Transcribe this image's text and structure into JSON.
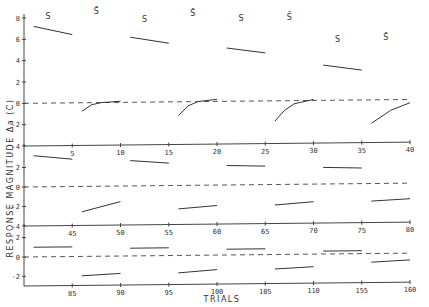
{
  "chart_data": {
    "type": "line",
    "title": "",
    "xlabel": "TRIALS",
    "ylabel": "RESPONSE MAGNITUDE  Δa (C)",
    "grid": false,
    "legend": null,
    "panels": [
      {
        "name": "top",
        "x_range": [
          0,
          40
        ],
        "x_ticks": [
          5,
          10,
          15,
          20,
          25,
          30,
          35,
          40
        ],
        "y_range": [
          -4,
          8
        ],
        "y_ticks": [
          8,
          6,
          4,
          2,
          0,
          -2,
          -4
        ],
        "reference_line": 0,
        "stimulus_markers": [
          {
            "label": "S",
            "x": 2.5,
            "y": 7.9
          },
          {
            "label": "S̄",
            "x": 7.5,
            "y": 8.3
          },
          {
            "label": "S",
            "x": 12.5,
            "y": 7.5
          },
          {
            "label": "S̄",
            "x": 17.5,
            "y": 8.0
          },
          {
            "label": "S",
            "x": 22.5,
            "y": 7.5
          },
          {
            "label": "S̄",
            "x": 27.5,
            "y": 7.6
          },
          {
            "label": "S",
            "x": 32.5,
            "y": 5.5
          },
          {
            "label": "S̄",
            "x": 37.5,
            "y": 5.6
          }
        ],
        "series": [
          {
            "name": "S trials 1-5",
            "x": [
              1,
              5
            ],
            "y": [
              7.2,
              6.4
            ]
          },
          {
            "name": "S-bar trials 6-10",
            "x": [
              6,
              7,
              8,
              10
            ],
            "y": [
              -0.8,
              -0.2,
              0.0,
              0.1
            ]
          },
          {
            "name": "S trials 11-15",
            "x": [
              11,
              15
            ],
            "y": [
              6.1,
              5.5
            ]
          },
          {
            "name": "S-bar trials 16-20",
            "x": [
              16,
              17,
              18,
              20
            ],
            "y": [
              -1.3,
              -0.4,
              0.0,
              0.2
            ]
          },
          {
            "name": "S trials 21-25",
            "x": [
              21,
              25
            ],
            "y": [
              5.0,
              4.5
            ]
          },
          {
            "name": "S-bar trials 26-30",
            "x": [
              26,
              27,
              28,
              30
            ],
            "y": [
              -1.9,
              -0.9,
              -0.3,
              0.1
            ]
          },
          {
            "name": "S trials 31-35",
            "x": [
              31,
              35
            ],
            "y": [
              3.3,
              2.8
            ]
          },
          {
            "name": "S-bar trials 36-40",
            "x": [
              36,
              38,
              40
            ],
            "y": [
              -2.2,
              -1.0,
              -0.3
            ]
          }
        ]
      },
      {
        "name": "middle",
        "x_range": [
          40,
          80
        ],
        "x_ticks": [
          45,
          50,
          55,
          60,
          65,
          70,
          75,
          80
        ],
        "y_range": [
          -4,
          4
        ],
        "y_ticks": [
          2,
          0,
          -2,
          -4
        ],
        "reference_line": 0,
        "series": [
          {
            "name": "S trials 41-45",
            "x": [
              41,
              45
            ],
            "y": [
              3.2,
              2.8
            ]
          },
          {
            "name": "S-bar trials 46-50",
            "x": [
              46,
              50
            ],
            "y": [
              -2.6,
              -1.6
            ]
          },
          {
            "name": "S trials 51-55",
            "x": [
              51,
              55
            ],
            "y": [
              2.6,
              2.3
            ]
          },
          {
            "name": "S-bar trials 56-60",
            "x": [
              56,
              60
            ],
            "y": [
              -2.4,
              -2.1
            ]
          },
          {
            "name": "S trials 61-65",
            "x": [
              61,
              65
            ],
            "y": [
              2.0,
              1.9
            ]
          },
          {
            "name": "S-bar trials 66-70",
            "x": [
              66,
              70
            ],
            "y": [
              -2.1,
              -1.8
            ]
          },
          {
            "name": "S trials 71-75",
            "x": [
              71,
              75
            ],
            "y": [
              1.7,
              1.6
            ]
          },
          {
            "name": "S-bar trials 76-80",
            "x": [
              76,
              80
            ],
            "y": [
              -1.8,
              -1.6
            ]
          }
        ]
      },
      {
        "name": "bottom",
        "x_range": [
          80,
          160
        ],
        "x_ticks": [
          85,
          90,
          95,
          100,
          105,
          110,
          155,
          160
        ],
        "x_axis_break": "between 110 and 155",
        "y_range": [
          -3,
          3
        ],
        "y_ticks": [
          2,
          0,
          -2
        ],
        "reference_line": 0,
        "series": [
          {
            "name": "S trials 81-85",
            "x": [
              81,
              85
            ],
            "y": [
              1.0,
              1.0
            ]
          },
          {
            "name": "S-bar trials 86-90",
            "x": [
              86,
              90
            ],
            "y": [
              -2.0,
              -1.8
            ]
          },
          {
            "name": "S trials 91-95",
            "x": [
              91,
              95
            ],
            "y": [
              0.8,
              0.8
            ]
          },
          {
            "name": "S-bar trials 96-100",
            "x": [
              96,
              100
            ],
            "y": [
              -1.8,
              -1.5
            ]
          },
          {
            "name": "S trials 101-105",
            "x": [
              101,
              105
            ],
            "y": [
              0.6,
              0.6
            ]
          },
          {
            "name": "S-bar trials 106-110",
            "x": [
              106,
              110
            ],
            "y": [
              -1.5,
              -1.3
            ]
          },
          {
            "name": "S trials 151-155",
            "x": [
              151,
              155
            ],
            "y": [
              0.3,
              0.3
            ]
          },
          {
            "name": "S-bar trials 156-160",
            "x": [
              156,
              160
            ],
            "y": [
              -0.9,
              -0.7
            ]
          }
        ]
      }
    ]
  },
  "labels": {
    "xlabel": "TRIALS",
    "ylabel": "RESPONSE  MAGNITUDE   Δa (C)"
  }
}
